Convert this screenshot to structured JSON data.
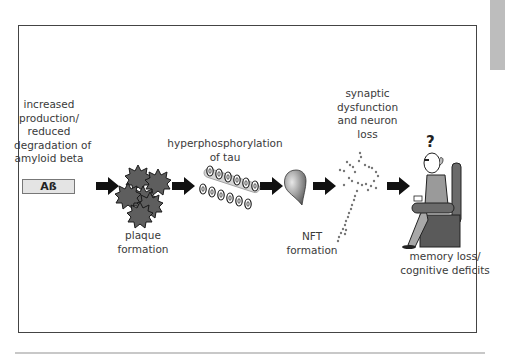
{
  "diagram": {
    "type": "process-flow",
    "steps": [
      {
        "id": "abeta",
        "label_lines": [
          "increased",
          "production/",
          "reduced",
          "degradation of",
          "amyloid beta"
        ],
        "badge": "Aß"
      },
      {
        "id": "plaque",
        "label_lines": [
          "plaque",
          "formation"
        ],
        "icon": "plaque-cluster-icon"
      },
      {
        "id": "tau",
        "label_lines": [
          "hyperphosphorylation",
          "of tau"
        ],
        "icon": "phosphorylated-tau-icon"
      },
      {
        "id": "nft",
        "label_lines": [
          "NFT",
          "formation"
        ],
        "icon": "neurofibrillary-tangle-icon"
      },
      {
        "id": "synapse",
        "label_lines": [
          "synaptic",
          "dysfunction",
          "and neuron",
          "loss"
        ],
        "icon": "degenerating-neuron-icon"
      },
      {
        "id": "memory",
        "label_lines": [
          "memory loss/",
          "cognitive deficits"
        ],
        "icon": "confused-elderly-man-icon",
        "symbol": "?"
      }
    ],
    "connector": "right-arrow-icon",
    "colors": {
      "frame": "#444444",
      "arrow": "#111111",
      "plaque": "#5e5e5e",
      "badge_fill": "#e4e4e4",
      "tau_rod": "#d6d6d6",
      "side_tab": "#bdbdbd"
    }
  }
}
